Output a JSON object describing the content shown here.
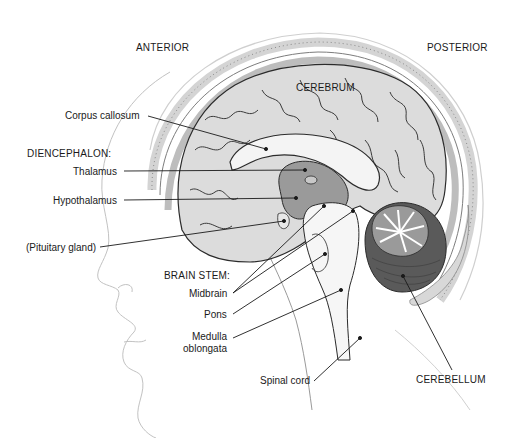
{
  "diagram": {
    "type": "labeled anatomical illustration",
    "orientation": {
      "anterior_label": "ANTERIOR",
      "posterior_label": "POSTERIOR"
    },
    "region_labels": {
      "cerebrum": "CEREBRUM",
      "cerebellum": "CEREBELLUM"
    },
    "labels": {
      "corpus_callosum": "Corpus callosum",
      "diencephalon_header": "DIENCEPHALON:",
      "thalamus": "Thalamus",
      "hypothalamus": "Hypothalamus",
      "pituitary": "(Pituitary gland)",
      "brainstem_header": "BRAIN STEM:",
      "midbrain": "Midbrain",
      "pons": "Pons",
      "medulla_line1": "Medulla",
      "medulla_line2": "oblongata",
      "spinal_cord": "Spinal cord"
    },
    "colors": {
      "background": "#ffffff",
      "text": "#1a1a1a",
      "outline": "#2b2b2b",
      "cerebrum_fill": "#d9d9d9",
      "gyri_light": "#ececec",
      "white_matter": "#f4f4f4",
      "diencephalon_fill": "#9a9a9a",
      "cerebellum_dark": "#5a5a5a",
      "skull_fill": "#cfcfcf",
      "face_line": "#b5b5b5"
    }
  }
}
